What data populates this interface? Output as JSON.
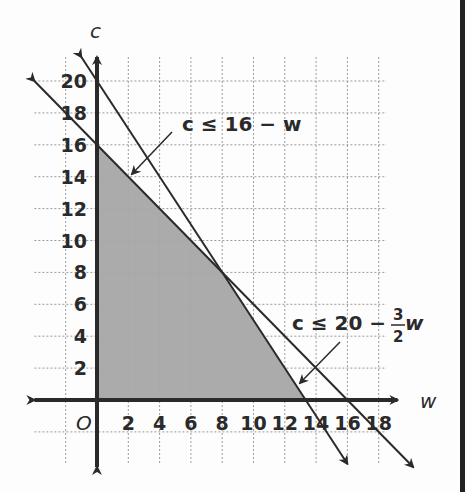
{
  "chart_data": {
    "type": "line",
    "title": "",
    "xlabel": "w",
    "ylabel": "c",
    "origin_label": "O",
    "xlim": [
      -4,
      20
    ],
    "ylim": [
      -4,
      22
    ],
    "grid": true,
    "x_ticks": [
      "2",
      "4",
      "6",
      "8",
      "10",
      "12",
      "14",
      "16",
      "18"
    ],
    "y_ticks": [
      "2",
      "4",
      "6",
      "8",
      "10",
      "12",
      "14",
      "16",
      "18",
      "20"
    ],
    "series": [
      {
        "name": "c ≤ 16 − w",
        "type": "boundary_line",
        "slope": -1,
        "intercept": 16,
        "points": [
          [
            -4,
            20
          ],
          [
            0,
            16
          ],
          [
            8,
            8
          ],
          [
            16,
            0
          ],
          [
            20,
            -4
          ]
        ]
      },
      {
        "name": "c ≤ 20 − (3/2)w",
        "type": "boundary_line",
        "slope": -1.5,
        "intercept": 20,
        "points": [
          [
            0,
            20
          ],
          [
            8,
            8
          ],
          [
            13.33,
            0
          ],
          [
            16,
            -4
          ]
        ]
      }
    ],
    "shaded_region": {
      "description": "feasible region w ≥ 0, c ≥ 0, c ≤ 16 − w, c ≤ 20 − 1.5w",
      "vertices": [
        [
          0,
          0
        ],
        [
          0,
          16
        ],
        [
          8,
          8
        ],
        [
          13.33,
          0
        ]
      ],
      "color": "#a6a6a6"
    },
    "annotations": [
      {
        "text": "c ≤ 16 − w",
        "points_to": [
          2,
          14
        ]
      },
      {
        "text_main": "c ≤ 20 − ",
        "fraction_num": "3",
        "fraction_den": "2",
        "text_var": "w",
        "points_to": [
          12.5,
          1
        ]
      }
    ]
  },
  "colors": {
    "line": "#2a2a2a",
    "shade": "#a6a6a6",
    "grid": "#9a9a9a",
    "background": "#fdfdfd"
  }
}
